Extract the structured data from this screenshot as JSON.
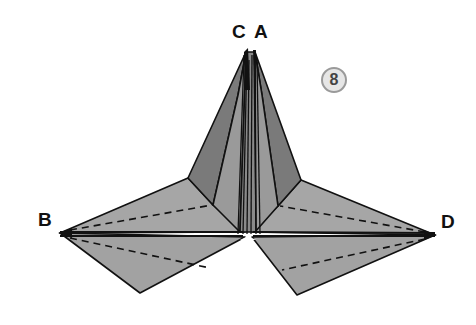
{
  "diagram": {
    "step_number": "8",
    "labels": {
      "c": "C",
      "a": "A",
      "b": "B",
      "d": "D"
    },
    "colors": {
      "paper_light": "#a8a8a8",
      "paper_mid": "#8f8f8f",
      "paper_dark": "#6e6e6e",
      "outline": "#111111",
      "badge_fill": "#e6e6e6",
      "badge_border": "#9a9a9a"
    }
  }
}
